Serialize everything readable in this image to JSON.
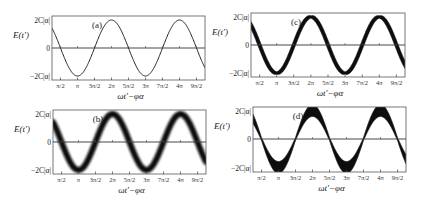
{
  "figure": {
    "panels": [
      {
        "id": "a",
        "label": "(a)",
        "style": "thin",
        "band": 0,
        "box": [
          52,
          16,
          205,
          80
        ],
        "zero_y": 48
      },
      {
        "id": "b",
        "label": "(b)",
        "style": "blurred",
        "band": 6,
        "box": [
          53,
          110,
          206,
          174
        ],
        "zero_y": 142
      },
      {
        "id": "c",
        "label": "(c)",
        "style": "band-varying",
        "band": 7,
        "box": [
          251,
          13,
          405,
          77
        ],
        "zero_y": 45
      },
      {
        "id": "d",
        "label": "(d)",
        "style": "band-growing",
        "band": 9,
        "box": [
          253,
          107,
          406,
          172
        ],
        "zero_y": 139
      }
    ],
    "y_axis_title": "E(t′)",
    "x_axis_title": "ωt′−φα",
    "y_ticks": [
      "2C|α|",
      "0",
      "−2C|α|"
    ],
    "x_ticks": [
      "π/2",
      "π",
      "3π/2",
      "2π",
      "5π/2",
      "3π",
      "7π/2",
      "4π",
      "9π/2"
    ]
  },
  "chart_data": [
    {
      "type": "line",
      "title": "(a)",
      "xlabel": "ωt′−φα",
      "ylabel": "E(t′)",
      "x_ticks": [
        "π/2",
        "π",
        "3π/2",
        "2π",
        "5π/2",
        "3π",
        "7π/2",
        "4π",
        "9π/2"
      ],
      "y_ticks": [
        "2C|α|",
        "0",
        "−2C|α|"
      ],
      "xlim": [
        "π/4",
        "19π/4"
      ],
      "ylim": [
        "-2.3C|α|",
        "2.3C|α|"
      ],
      "series": [
        {
          "name": "E(t′)",
          "function": "2C|α| cos(ωt′−φα)",
          "width": "thin"
        }
      ],
      "grid": false
    },
    {
      "type": "line",
      "title": "(b)",
      "xlabel": "ωt′−φα",
      "ylabel": "E(t′)",
      "x_ticks": [
        "π/2",
        "π",
        "3π/2",
        "2π",
        "5π/2",
        "3π",
        "7π/2",
        "4π",
        "9π/2"
      ],
      "y_ticks": [
        "2C|α|",
        "0",
        "−2C|α|"
      ],
      "series": [
        {
          "name": "E(t′)",
          "function": "2C|α| cos(ωt′−φα)",
          "width": "uniform blurred band"
        }
      ],
      "grid": false
    },
    {
      "type": "area",
      "title": "(c)",
      "xlabel": "ωt′−φα",
      "ylabel": "E(t′)",
      "x_ticks": [
        "π/2",
        "π",
        "3π/2",
        "2π",
        "5π/2",
        "3π",
        "7π/2",
        "4π",
        "9π/2"
      ],
      "y_ticks": [
        "2C|α|",
        "0",
        "−2C|α|"
      ],
      "series": [
        {
          "name": "E(t′)",
          "function": "2C|α| cos(ωt′−φα)",
          "width": "band, thin at extrema, wide at zero crossings"
        }
      ],
      "grid": false
    },
    {
      "type": "area",
      "title": "(d)",
      "xlabel": "ωt′−φα",
      "ylabel": "E(t′)",
      "x_ticks": [
        "π/2",
        "π",
        "3π/2",
        "2π",
        "5π/2",
        "3π",
        "7π/2",
        "4π",
        "9π/2"
      ],
      "y_ticks": [
        "2C|α|",
        "0",
        "−2C|α|"
      ],
      "series": [
        {
          "name": "E(t′)",
          "function": "2C|α| cos(ωt′−φα)",
          "width": "band, wide at extrema, thin at zero crossings"
        }
      ],
      "grid": false
    }
  ]
}
